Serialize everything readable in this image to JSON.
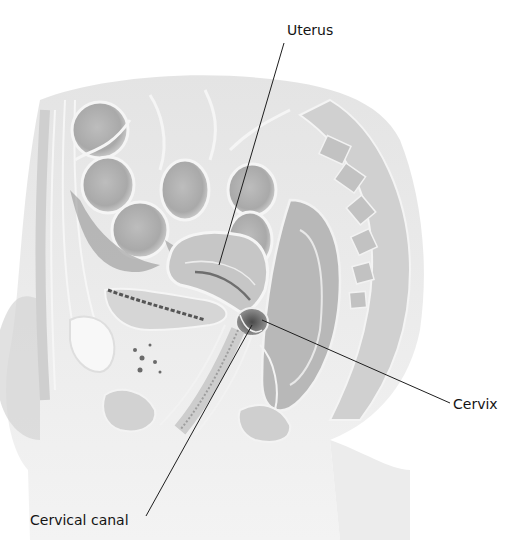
{
  "figure": {
    "labels": [
      {
        "id": "uterus",
        "text": "Uterus",
        "leader": {
          "from": [
            284,
            43
          ],
          "to": [
            219,
            265
          ]
        }
      },
      {
        "id": "cervix",
        "text": "Cervix",
        "leader": {
          "from": [
            450,
            403
          ],
          "to": [
            262,
            320
          ]
        }
      },
      {
        "id": "cervical_canal",
        "text": "Cervical canal",
        "leader": {
          "from": [
            146,
            516
          ],
          "to": [
            252,
            325
          ]
        }
      }
    ],
    "colors": {
      "background": "#ffffff",
      "leader_line": "#1e1e1e",
      "label_text": "#141414",
      "tissue_light": "#e2e2e2",
      "tissue_mid": "#c8c8c8",
      "tissue_dark": "#9a9a9a",
      "outline_highlight": "#f4f4f4"
    }
  }
}
